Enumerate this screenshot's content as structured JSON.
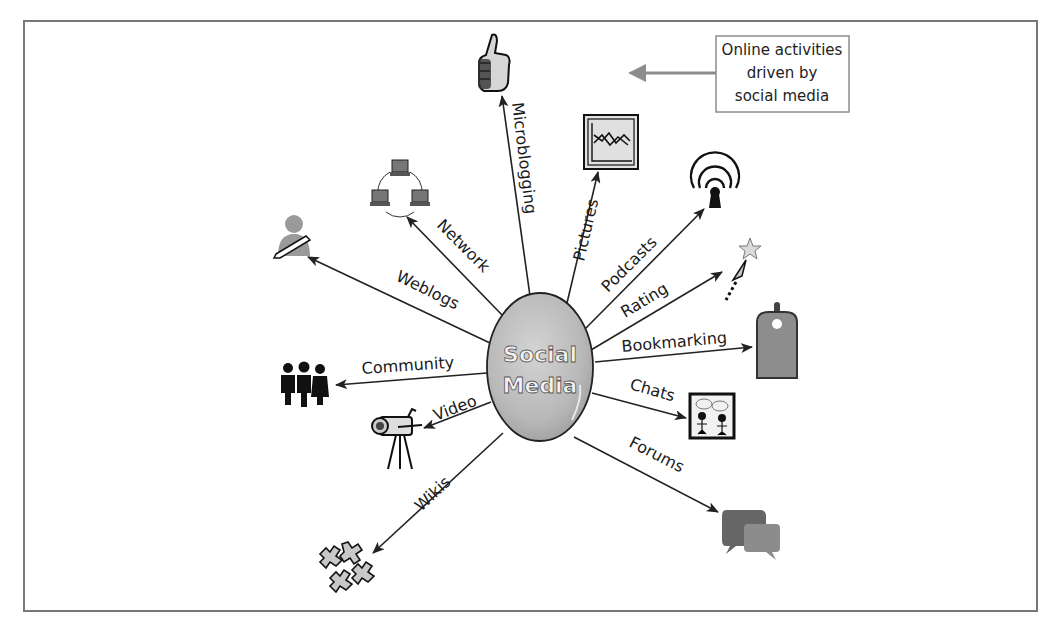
{
  "diagram": {
    "type": "hub-and-spoke",
    "hub": {
      "line1": "Social",
      "line2": "Media"
    },
    "legend": {
      "line1": "Online activities",
      "line2": "driven by",
      "line3": "social media",
      "arrow_direction": "left"
    },
    "spokes": [
      {
        "label": "Microblogging",
        "icon": "thumbs-up-icon"
      },
      {
        "label": "Pictures",
        "icon": "picture-chart-icon"
      },
      {
        "label": "Podcasts",
        "icon": "podcast-broadcast-icon"
      },
      {
        "label": "Rating",
        "icon": "star-rating-icon"
      },
      {
        "label": "Bookmarking",
        "icon": "bookmark-tag-icon"
      },
      {
        "label": "Chats",
        "icon": "chat-people-icon"
      },
      {
        "label": "Forums",
        "icon": "forum-speech-bubbles-icon"
      },
      {
        "label": "Wikis",
        "icon": "wiki-puzzle-icon"
      },
      {
        "label": "Video",
        "icon": "video-camera-icon"
      },
      {
        "label": "Community",
        "icon": "community-people-icon"
      },
      {
        "label": "Weblogs",
        "icon": "weblog-writer-icon"
      },
      {
        "label": "Network",
        "icon": "computer-network-icon"
      }
    ]
  },
  "colors": {
    "frame": "#777777",
    "hub_fill": "#bdbdbd",
    "icon_gray": "#8a8a8a",
    "line": "#222222",
    "legend_arrow": "#8c8c8c"
  }
}
